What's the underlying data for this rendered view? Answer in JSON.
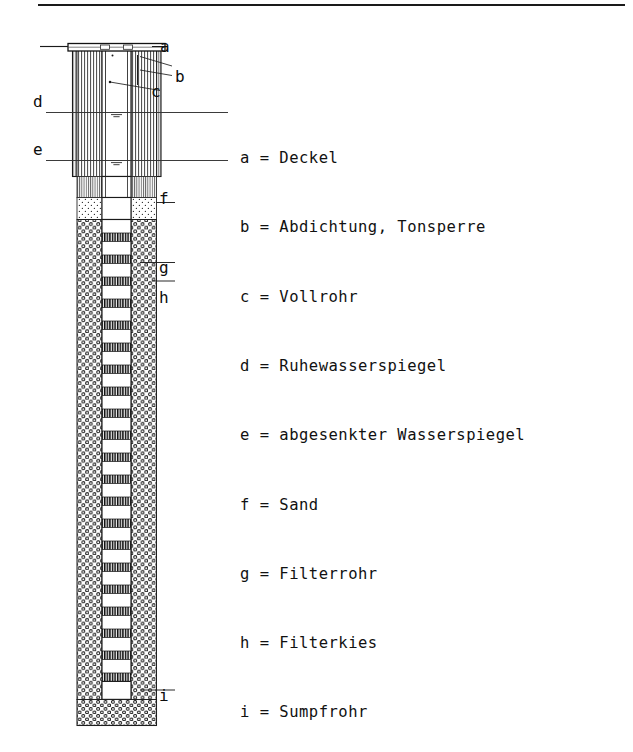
{
  "figure": {
    "type": "well-construction-cross-section"
  },
  "legend": {
    "separator": " = ",
    "items": [
      {
        "key": "a",
        "label": "Deckel"
      },
      {
        "key": "b",
        "label": "Abdichtung, Tonsperre"
      },
      {
        "key": "c",
        "label": "Vollrohr"
      },
      {
        "key": "d",
        "label": "Ruhewasserspiegel"
      },
      {
        "key": "e",
        "label": "abgesenkter Wasserspiegel"
      },
      {
        "key": "f",
        "label": "Sand"
      },
      {
        "key": "g",
        "label": "Filterrohr"
      },
      {
        "key": "h",
        "label": "Filterkies"
      },
      {
        "key": "i",
        "label": "Sumpfrohr"
      }
    ]
  },
  "callouts": {
    "a": "a",
    "b": "b",
    "c": "c",
    "d": "d",
    "e": "e",
    "f": "f",
    "g": "g",
    "h": "h",
    "i": "i"
  },
  "colors": {
    "ink": "#111111",
    "line": "#1a1a1a",
    "hatch": "#3a3a3a",
    "fill": "#ffffff",
    "slot": "#141414",
    "page": "#ffffff"
  }
}
